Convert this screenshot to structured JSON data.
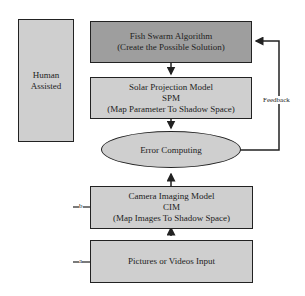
{
  "human": {
    "line1": "Human",
    "line2": "Assisted"
  },
  "fish": {
    "line1": "Fish Swarm Algorithm",
    "line2": "(Create the Possible Solution)"
  },
  "spm": {
    "line1": "Solar Projection Model",
    "line2": "SPM",
    "line3": "(Map Parameter To Shadow Space)"
  },
  "error": {
    "label": "Error Computing"
  },
  "cim": {
    "line1": "Camera Imaging Model",
    "line2": "CIM",
    "line3": "(Map Images To Shadow Space)"
  },
  "input": {
    "label": "Pictures or Videos Input"
  },
  "feedback": {
    "label": "Feedback"
  },
  "connectors": {
    "a": "a",
    "b": "b"
  },
  "colors": {
    "dark_box": "#9e9e9e",
    "light_box": "#cfcfcf",
    "line": "#222222"
  }
}
